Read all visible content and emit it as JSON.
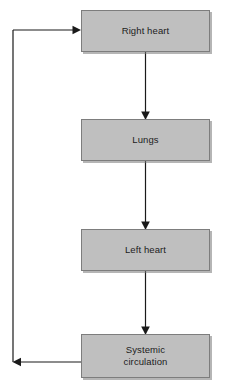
{
  "diagram": {
    "background_color": "#ffffff",
    "node_fill_color": "#bfbfbf",
    "node_border_color": "#7d7d7d",
    "connector_color": "#1a1a1a",
    "text_color": "#1c1c1c",
    "nodes": [
      {
        "id": "right-heart",
        "label": "Right heart"
      },
      {
        "id": "lungs",
        "label": "Lungs"
      },
      {
        "id": "left-heart",
        "label": "Left heart"
      },
      {
        "id": "systemic",
        "label": "Systemic\ncirculation",
        "line1": "Systemic",
        "line2": "circulation"
      }
    ],
    "connectors": [
      {
        "id": "right-heart-to-lungs",
        "from": "right-heart",
        "to": "lungs",
        "direction": "down",
        "arrowhead": "filled-triangle"
      },
      {
        "id": "lungs-to-left-heart",
        "from": "lungs",
        "to": "left-heart",
        "direction": "down",
        "arrowhead": "filled-triangle"
      },
      {
        "id": "left-heart-to-systemic",
        "from": "left-heart",
        "to": "systemic",
        "direction": "down",
        "arrowhead": "filled-triangle"
      },
      {
        "id": "systemic-to-left-rail",
        "from": "systemic",
        "to": "left-rail",
        "direction": "left",
        "arrowhead": "filled-triangle"
      },
      {
        "id": "left-rail-to-right-heart",
        "from": "left-rail",
        "to": "right-heart",
        "direction": "right",
        "arrowhead": "filled-triangle"
      }
    ]
  }
}
